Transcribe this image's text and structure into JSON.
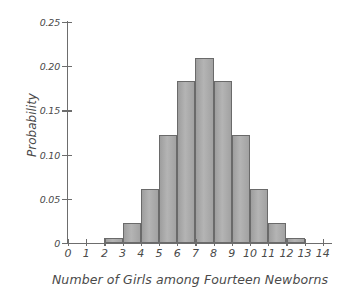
{
  "chart_data": {
    "type": "bar",
    "title": "",
    "xlabel": "Number of Girls among Fourteen Newborns",
    "ylabel": "Probability",
    "categories": [
      "0",
      "1",
      "2",
      "3",
      "4",
      "5",
      "6",
      "7",
      "8",
      "9",
      "10",
      "11",
      "12",
      "13",
      "14"
    ],
    "values": [
      0.0001,
      0.0009,
      0.0056,
      0.0222,
      0.0611,
      0.1222,
      0.1833,
      0.2095,
      0.1833,
      0.1222,
      0.0611,
      0.0222,
      0.0056,
      0.0009,
      0.0001
    ],
    "xlim": [
      0,
      14
    ],
    "ylim": [
      0,
      0.25
    ],
    "x_tick_labels": [
      "0",
      "1",
      "2",
      "3",
      "4",
      "5",
      "6",
      "7",
      "8",
      "9",
      "10",
      "11",
      "12",
      "13",
      "14"
    ],
    "y_tick_labels": [
      "0",
      "0.05",
      "0.10",
      "0.15",
      "0.20",
      "0.25"
    ],
    "y_tick_values": [
      0,
      0.05,
      0.1,
      0.15,
      0.2,
      0.25
    ],
    "grid": false,
    "legend": null,
    "bar_fill_color": "#a8a8a8",
    "bar_edge_color": "#6a6a6a",
    "axis_color": "#6d6d6d",
    "text_color": "#4a4a4a",
    "background_color": "#ffffff",
    "bar_alignment": "between-ticks"
  }
}
